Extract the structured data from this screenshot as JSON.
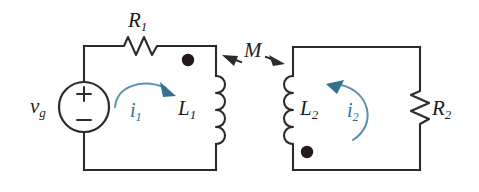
{
  "figure": {
    "kind": "circuit-schematic",
    "background_color": "#ffffff",
    "wire_color": "#2b2b2b",
    "current_color": "#31708f",
    "dot_color": "#231a19"
  },
  "labels": {
    "source": {
      "symbol": "v",
      "subscript": "g",
      "name": "source-voltage"
    },
    "resistor1": {
      "symbol": "R",
      "subscript": "1",
      "name": "resistor-r1"
    },
    "resistor2": {
      "symbol": "R",
      "subscript": "2",
      "name": "resistor-r2"
    },
    "inductor1": {
      "symbol": "L",
      "subscript": "1",
      "name": "inductor-l1"
    },
    "inductor2": {
      "symbol": "L",
      "subscript": "2",
      "name": "inductor-l2"
    },
    "mutual": {
      "symbol": "M",
      "subscript": "",
      "name": "mutual-inductance"
    },
    "current1": {
      "symbol": "i",
      "subscript": "1",
      "name": "mesh-current-i1"
    },
    "current2": {
      "symbol": "i",
      "subscript": "2",
      "name": "mesh-current-i2"
    },
    "plus": "+",
    "minus": "−"
  },
  "components": {
    "left_loop": {
      "name": "primary-loop",
      "elements": [
        "voltage-source-vg",
        "resistor-r1",
        "inductor-l1"
      ],
      "current_direction": "clockwise",
      "dot_position": "top"
    },
    "right_loop": {
      "name": "secondary-loop",
      "elements": [
        "inductor-l2",
        "resistor-r2"
      ],
      "current_direction": "counterclockwise",
      "dot_position": "bottom"
    },
    "coupling": {
      "name": "mutual-coupling",
      "label": "M",
      "arrows": "double-headed"
    }
  }
}
